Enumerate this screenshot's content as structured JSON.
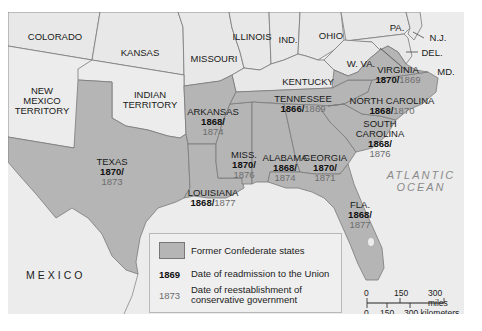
{
  "map": {
    "colors": {
      "confederate_fill": "#b5b5b5",
      "union_fill": "#e8e8e8",
      "territory_fill": "#ececec",
      "water": "#ececec",
      "border": "#7a7a7a",
      "admission_year": "#111111",
      "restoration_year": "#6d6d6d"
    },
    "non_confederate_regions": [
      {
        "name": "COLORADO"
      },
      {
        "name": "KANSAS"
      },
      {
        "name": "MISSOURI"
      },
      {
        "name": "ILLINOIS"
      },
      {
        "name": "IND."
      },
      {
        "name": "OHIO"
      },
      {
        "name": "PA."
      },
      {
        "name": "N.J."
      },
      {
        "name": "DEL."
      },
      {
        "name": "MD."
      },
      {
        "name": "W. VA."
      },
      {
        "name": "KENTUCKY"
      },
      {
        "name_line1": "NEW",
        "name_line2": "MEXICO",
        "name_line3": "TERRITORY"
      },
      {
        "name_line1": "INDIAN",
        "name_line2": "TERRITORY"
      }
    ],
    "confederate_states": [
      {
        "name": "TEXAS",
        "readmitted": "1870/",
        "restored": "1873"
      },
      {
        "name": "ARKANSAS",
        "readmitted": "1868/",
        "restored": "1874"
      },
      {
        "name": "LOUISIANA",
        "readmitted": "1868/",
        "restored": "1877"
      },
      {
        "name": "MISS.",
        "readmitted": "1870/",
        "restored": "1876"
      },
      {
        "name": "ALABAMA",
        "readmitted": "1868/",
        "restored": "1874"
      },
      {
        "name": "GEORGIA",
        "readmitted": "1870/",
        "restored": "1871"
      },
      {
        "name": "FLA.",
        "readmitted": "1868/",
        "restored": "1877"
      },
      {
        "name": "TENNESSEE",
        "readmitted": "1866/",
        "restored": "1869"
      },
      {
        "name_line1": "SOUTH",
        "name_line2": "CAROLINA",
        "readmitted": "1868/",
        "restored": "1876"
      },
      {
        "name": "NORTH CAROLINA",
        "readmitted": "1868/",
        "restored": "1870"
      },
      {
        "name": "VIRGINIA",
        "readmitted": "1870/",
        "restored": "1869"
      }
    ],
    "water_labels": {
      "ocean_line1": "ATLANTIC",
      "ocean_line2": "OCEAN"
    },
    "country_labels": {
      "mexico": "MEXICO"
    }
  },
  "legend": {
    "swatch_label": "Former Confederate states",
    "admission_key": "1869",
    "admission_label": "Date of readmission to the Union",
    "restoration_key": "1873",
    "restoration_label_line1": "Date of reestablishment of",
    "restoration_label_line2": "conservative government"
  },
  "scale_bar": {
    "miles": [
      "0",
      "150",
      "300 miles"
    ],
    "kilometers": [
      "0",
      "150",
      "300 kilometers"
    ]
  }
}
